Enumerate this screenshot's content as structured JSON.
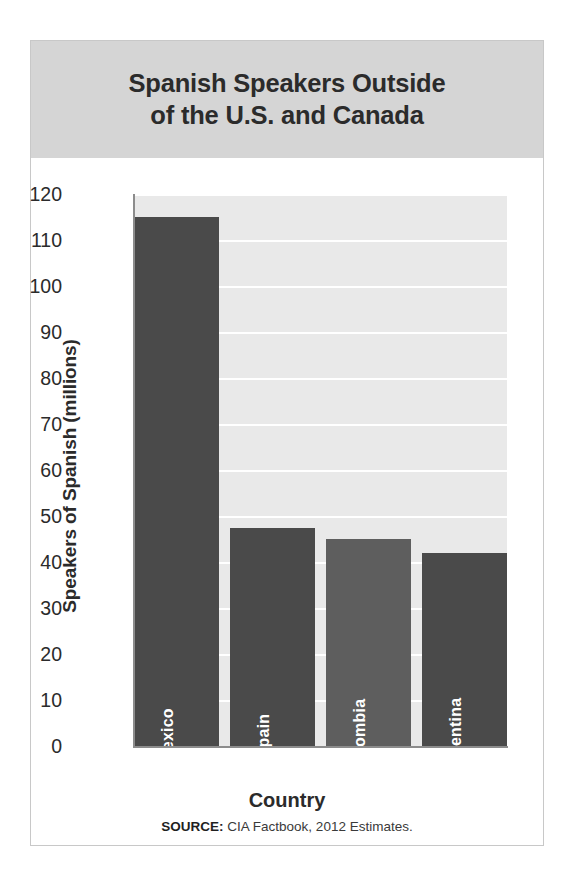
{
  "figure": {
    "title": "Spanish Speakers Outside of the U.S. and Canada",
    "title_line1": "Spanish Speakers Outside",
    "title_line2": "of the U.S. and Canada",
    "source_key": "SOURCE:",
    "source_text": " CIA Factbook, 2012 Estimates.",
    "title_band_color": "#d5d5d5",
    "plot_background_color": "#e9e9e9",
    "gridline_color": "#ffffff",
    "axis_color": "#8c8c8c"
  },
  "chart_data": {
    "type": "bar",
    "title": "Spanish Speakers Outside of the U.S. and Canada",
    "xlabel": "Country",
    "ylabel": "Speakers of Spanish (millions)",
    "categories": [
      "Mexico",
      "Spain",
      "Colombia",
      "Argentina"
    ],
    "values": [
      115,
      47.5,
      45,
      42
    ],
    "bar_colors": [
      "#4a4a4a",
      "#4a4a4a",
      "#5e5e5e",
      "#4a4a4a"
    ],
    "ylim": [
      0,
      120
    ],
    "ytick_step": 10,
    "yticks": [
      0,
      10,
      20,
      30,
      40,
      50,
      60,
      70,
      80,
      90,
      100,
      110,
      120
    ],
    "ytick_labels": [
      "0",
      "10",
      "20",
      "30",
      "40",
      "50",
      "60",
      "70",
      "80",
      "90",
      "100",
      "110",
      "120"
    ],
    "grid": true,
    "grid_axis": "y",
    "legend": false,
    "bar_label_position": "inside-bottom",
    "bar_label_rotation": -90,
    "bar_label_color": "#ffffff"
  }
}
